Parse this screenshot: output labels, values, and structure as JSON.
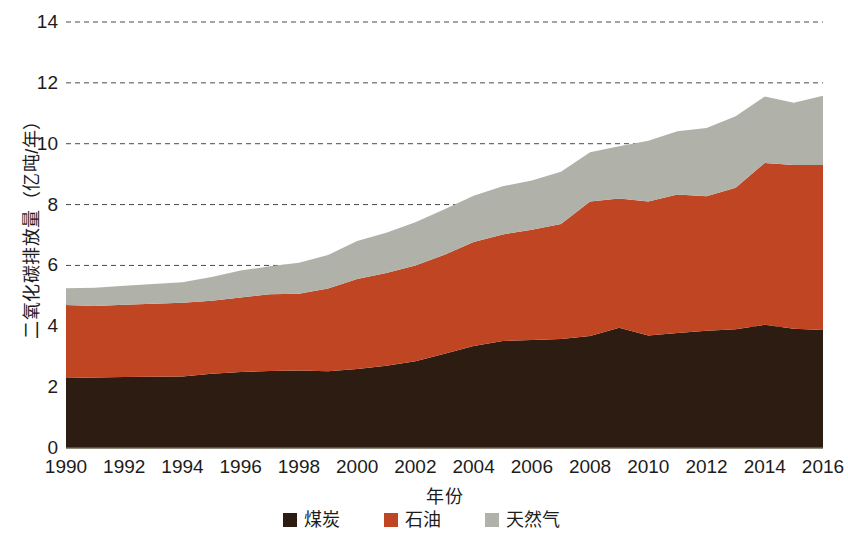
{
  "chart_data": {
    "type": "area",
    "stacked": true,
    "title": "",
    "xlabel": "年份",
    "ylabel": "二氧化碳排放量（亿吨/年）",
    "x": [
      1990,
      1991,
      1992,
      1993,
      1994,
      1995,
      1996,
      1997,
      1998,
      1999,
      2000,
      2001,
      2002,
      2003,
      2004,
      2005,
      2006,
      2007,
      2008,
      2009,
      2010,
      2011,
      2012,
      2013,
      2014,
      2015,
      2016
    ],
    "xticks": [
      "1990",
      "1992",
      "1994",
      "1996",
      "1998",
      "2000",
      "2002",
      "2004",
      "2006",
      "2008",
      "2010",
      "2012",
      "2014",
      "2016"
    ],
    "xtick_values": [
      1990,
      1992,
      1994,
      1996,
      1998,
      2000,
      2002,
      2004,
      2006,
      2008,
      2010,
      2012,
      2014,
      2016
    ],
    "yticks": [
      "0",
      "2",
      "4",
      "6",
      "8",
      "10",
      "12",
      "14"
    ],
    "ytick_values": [
      0,
      2,
      4,
      6,
      8,
      10,
      12,
      14
    ],
    "ylim": [
      0,
      14
    ],
    "xlim": [
      1990,
      2016
    ],
    "grid": "horizontal-dashed",
    "legend_position": "bottom-center",
    "series": [
      {
        "name": "煤炭",
        "color": "#2d1c11",
        "values": [
          2.3,
          2.32,
          2.33,
          2.34,
          2.35,
          2.44,
          2.5,
          2.53,
          2.55,
          2.52,
          2.6,
          2.7,
          2.85,
          3.1,
          3.35,
          3.52,
          3.55,
          3.58,
          3.68,
          3.95,
          3.7,
          3.78,
          3.85,
          3.9,
          4.05,
          3.92,
          3.88
        ]
      },
      {
        "name": "石油",
        "color": "#bf4523",
        "values": [
          2.4,
          2.35,
          2.38,
          2.4,
          2.42,
          2.4,
          2.45,
          2.52,
          2.52,
          2.72,
          2.95,
          3.05,
          3.15,
          3.25,
          3.42,
          3.5,
          3.62,
          3.78,
          4.42,
          4.25,
          4.4,
          4.55,
          4.42,
          4.65,
          5.32,
          5.38,
          5.42
        ]
      },
      {
        "name": "天然气",
        "color": "#b0b1a8",
        "values": [
          0.55,
          0.6,
          0.62,
          0.65,
          0.68,
          0.78,
          0.88,
          0.92,
          1.02,
          1.1,
          1.25,
          1.32,
          1.42,
          1.5,
          1.52,
          1.58,
          1.62,
          1.72,
          1.62,
          1.72,
          2.0,
          2.08,
          2.25,
          2.35,
          2.18,
          2.05,
          2.28
        ]
      }
    ],
    "totals": [
      5.25,
      5.27,
      5.33,
      5.39,
      5.45,
      5.62,
      5.83,
      5.97,
      6.09,
      6.34,
      6.8,
      7.07,
      7.42,
      7.85,
      8.29,
      8.6,
      8.79,
      9.08,
      9.72,
      9.92,
      10.1,
      10.41,
      10.52,
      10.9,
      11.55,
      11.35,
      11.58
    ]
  },
  "legend": {
    "items": [
      {
        "label": "煤炭",
        "color": "#2d1c11"
      },
      {
        "label": "石油",
        "color": "#bf4523"
      },
      {
        "label": "天然气",
        "color": "#b0b1a8"
      }
    ]
  }
}
